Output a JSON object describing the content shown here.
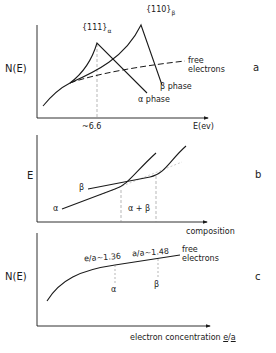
{
  "panel_a": {
    "letter": "a",
    "ylabel": "N(E)",
    "xlabel": "E(ev)",
    "tick_label": "~6.6",
    "peak_alpha_label": "{111}",
    "peak_alpha_sub": "α",
    "peak_beta_label": "{110}",
    "peak_beta_sub": "β",
    "free_line1": "free",
    "free_line2": "electrons",
    "beta_phase": "β phase",
    "alpha_phase": "α phase"
  },
  "panel_b": {
    "letter": "b",
    "ylabel": "E",
    "xlabel": "composition",
    "alpha": "α",
    "beta": "β",
    "two_phase": "α + β"
  },
  "panel_c": {
    "letter": "c",
    "ylabel": "N(E)",
    "xlabel_text": "electron concentration ",
    "xlabel_e": "e",
    "xlabel_slash": "/",
    "xlabel_a": "a",
    "ea_alpha": "e/a~1.36",
    "ea_beta": "a/a~1.48",
    "free_line1": "free",
    "free_line2": "electrons",
    "alpha": "α",
    "beta": "β"
  },
  "colors": {
    "ink": "#1a1a1a",
    "guide": "#888888"
  }
}
